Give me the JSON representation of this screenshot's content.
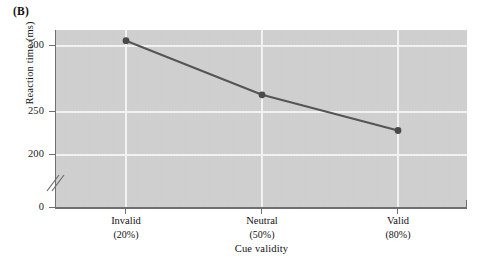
{
  "figure": {
    "panel_label": "(B)"
  },
  "chart_data": {
    "type": "line",
    "title": "",
    "xlabel": "Cue validity",
    "ylabel": "Reaction time (ms)",
    "categories": [
      "Invalid",
      "Neutral",
      "Valid"
    ],
    "category_sublabels": [
      "(20%)",
      "(50%)",
      "(80%)"
    ],
    "series": [
      {
        "name": "Reaction time",
        "values": [
          304,
          263,
          236
        ]
      }
    ],
    "ylim": [
      0,
      325
    ],
    "y_ticks": [
      0,
      200,
      250,
      300
    ],
    "y_tick_labels": [
      "0",
      "200",
      "250",
      "300"
    ],
    "y_axis_break": true,
    "y_axis_break_between": [
      0,
      200
    ],
    "grid": "white gridlines, horizontal at y ticks and vertical at categories",
    "legend": "none",
    "marker": "filled circle",
    "line_color": "#555555",
    "marker_color": "#4a4a4a",
    "plot_background": "#cfcfcf",
    "gridline_color": "#f4f4f4",
    "axis_color": "#6f6f6f"
  },
  "axis_labels": {
    "y_300": "300",
    "y_250": "250",
    "y_200": "200",
    "y_0": "0"
  }
}
